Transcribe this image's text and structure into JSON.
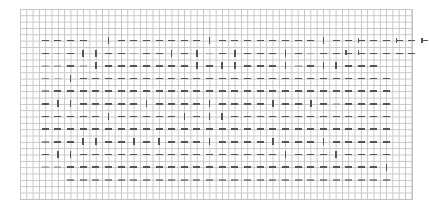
{
  "diagram": {
    "type": "chart-grid-pattern",
    "grid": {
      "columns": 62,
      "rows": 30,
      "line_color": "#c4c4c4",
      "mark_color": "#555555"
    },
    "mark_origin": {
      "col": 4,
      "row": 5
    },
    "mark_step": 2,
    "legend": {
      "h": "horizontal dash",
      "v": "vertical dash",
      "a": "arrow",
      "f": "faint dash",
      "l": "light dash",
      " ": "empty"
    },
    "rows": [
      "hhhh vhhhhhhhvhhhhhhhhvhhahhahaha",
      "h.hvvhh.hhvhv.hvhhhvh.hhaahhhh",
      "f.h.vhhhhhhhvhvvhhhv.hvvhhh",
      "l.vhhhhhhhhhhhhhhhhhhhhhhhhh",
      "lhhhhhhhhhhhhhhhhhhhhhhhhhhh",
      "hvvhhhhhvhhhhvhhhhvhhvh.hhhh",
      "hhhhhvhhhhhvhvvhhhhhhhhhhhhh",
      "hhhhhhhhhhhhhhhhhhhhhhhhhhhh",
      "lhhvvhhvhvhhhvhhhhvhhhvhhhhh",
      "hvvhhhhhhhhhhhhhhhhvhhhvhhhh",
      "f.hhhhhhhhhhhhhhhhhhhhhhhhhv",
      "  llllllllllllllllllllllllll"
    ]
  }
}
